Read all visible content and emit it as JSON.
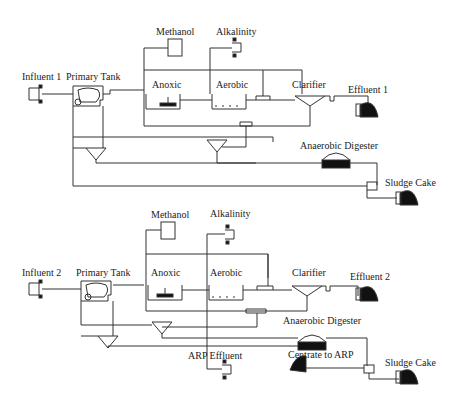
{
  "diagram": {
    "type": "process-flow",
    "plants": [
      {
        "id": "plant-1",
        "labels": {
          "influent": "Influent 1",
          "primary_tank": "Primary Tank",
          "methanol": "Methanol",
          "alkalinity": "Alkalinity",
          "anoxic": "Anoxic",
          "aerobic": "Aerobic",
          "clarifier": "Clarifier",
          "effluent": "Effluent 1",
          "digester": "Anaerobic Digester",
          "sludge_cake": "Sludge Cake"
        }
      },
      {
        "id": "plant-2",
        "labels": {
          "influent": "Influent 2",
          "primary_tank": "Primary Tank",
          "methanol": "Methanol",
          "alkalinity": "Alkalinity",
          "anoxic": "Anoxic",
          "aerobic": "Aerobic",
          "clarifier": "Clarifier",
          "effluent": "Effluent 2",
          "digester": "Anaerobic Digester",
          "arp_effluent": "ARP Effluent",
          "centrate": "Centrate to ARP",
          "sludge_cake": "Sludge Cake"
        }
      }
    ],
    "colors": {
      "line": "#333333",
      "fill": "#111111",
      "background": "#ffffff"
    }
  }
}
